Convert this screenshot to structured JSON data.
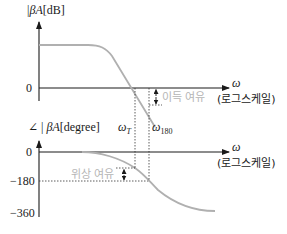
{
  "magnitude_plot": {
    "y_label_prefix": "|",
    "y_label_beta_a": "βA",
    "y_label_unit": "[dB]",
    "tick_zero": "0",
    "x_label": "ω",
    "x_scale_label": "(로그스케일)",
    "gain_margin_label": "이득 여유"
  },
  "phase_plot": {
    "y_label_angle": "∠",
    "y_label_beta_a": "βA",
    "y_label_unit": "[degree]",
    "ticks": [
      "0",
      "−180",
      "−360"
    ],
    "x_label": "ω",
    "x_scale_label": "(로그스케일)",
    "phase_margin_label": "위상 여유"
  },
  "markers": {
    "omega_t": "ω",
    "omega_t_sub": "T",
    "omega_180": "ω",
    "omega_180_sub": "180"
  },
  "colors": {
    "axis": "#1a1a1a",
    "curve": "#b0b0b0",
    "dashed": "#333333",
    "margin_text": "#b5b5b5"
  }
}
